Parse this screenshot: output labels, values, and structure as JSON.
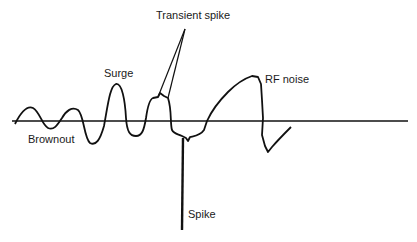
{
  "diagram": {
    "labels": {
      "transient_spike": "Transient spike",
      "surge": "Surge",
      "rf_noise": "RF noise",
      "brownout": "Brownout",
      "spike": "Spike"
    },
    "colors": {
      "line": "#111111",
      "background": "#ffffff"
    }
  }
}
